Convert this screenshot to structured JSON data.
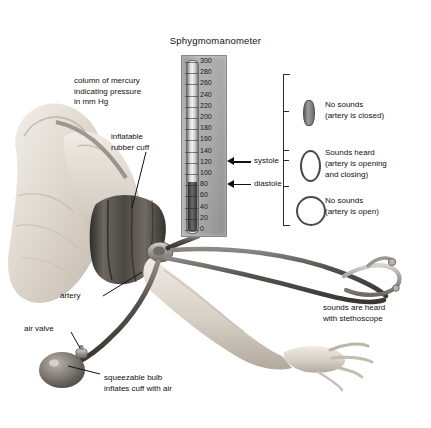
{
  "figure": {
    "title": "Sphygmomanometer",
    "domain_kind": "medical-diagram"
  },
  "manometer": {
    "unit_note": "mm Hg",
    "scale_max": 300,
    "scale_min": 0,
    "scale_step": 20,
    "ticks": [
      300,
      280,
      260,
      240,
      220,
      200,
      180,
      160,
      140,
      120,
      100,
      80,
      60,
      40,
      20,
      0
    ],
    "mercury_level": 85,
    "pointers": [
      {
        "name": "systole",
        "label": "systole",
        "value": 120
      },
      {
        "name": "diastole",
        "label": "diastole",
        "value": 80
      }
    ]
  },
  "labels": {
    "mercury_column": "column of mercury\nindicating pressure\nin mm Hg",
    "cuff": "inflatable\nrubber cuff",
    "artery": "artery",
    "air_valve": "air valve",
    "bulb": "squeezable bulb\ninflates cuff with air",
    "stethoscope": "sounds are heard\nwith stethoscope"
  },
  "sound_states": [
    {
      "icon": "artery-closed-icon",
      "heading": "No sounds",
      "detail": "(artery is closed)",
      "pressure_range": "above systolic"
    },
    {
      "icon": "artery-partially-open-icon",
      "heading": "Sounds heard",
      "detail": "(artery is opening\nand closing)",
      "pressure_range": "between systolic and diastolic"
    },
    {
      "icon": "artery-open-icon",
      "heading": "No sounds",
      "detail": "(artery is open)",
      "pressure_range": "below diastolic"
    }
  ],
  "colors": {
    "background": "#ffffff",
    "ink": "#111111",
    "panel_gray": "#a8a8a8",
    "mercury_dark": "#3a3a3a",
    "cuff_dark": "#4a4744",
    "skin_light": "#ded8cf"
  }
}
